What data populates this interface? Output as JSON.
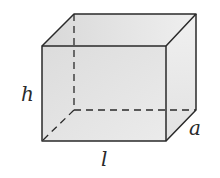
{
  "diagram": {
    "type": "rectangular-prism",
    "labels": {
      "height": "h",
      "length": "l",
      "depth": "a"
    },
    "colors": {
      "edge": "#2a2a2a",
      "front_face": "#e4e4e4",
      "top_face": "#ececec",
      "side_face": "#e9e9e9",
      "background": "#ffffff"
    }
  }
}
